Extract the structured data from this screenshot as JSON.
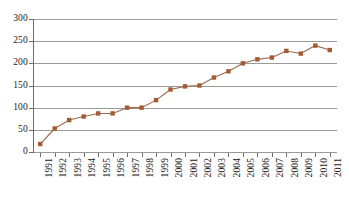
{
  "chart_data": {
    "type": "line",
    "title": "",
    "subtitle": "",
    "xlabel": "",
    "ylabel": "",
    "categories": [
      "1991",
      "1992",
      "1993",
      "1994",
      "1995",
      "1996",
      "1997",
      "1998",
      "1999",
      "2000",
      "2001",
      "2002",
      "2003",
      "2004",
      "2005",
      "2006",
      "2007",
      "2008",
      "2009",
      "2010",
      "2011"
    ],
    "values": [
      18,
      53,
      72,
      80,
      87,
      87,
      100,
      100,
      117,
      141,
      148,
      150,
      168,
      182,
      200,
      209,
      213,
      228,
      222,
      240,
      230
    ],
    "series": [
      {
        "name": "series-1",
        "values": [
          18,
          53,
          72,
          80,
          87,
          87,
          100,
          100,
          117,
          141,
          148,
          150,
          168,
          182,
          200,
          209,
          213,
          228,
          222,
          240,
          230
        ]
      }
    ],
    "ylim": [
      0,
      300
    ],
    "y_ticks": [
      0,
      50,
      100,
      150,
      200,
      250,
      300
    ],
    "y_tick_labels": [
      "0",
      "50",
      "100",
      "150",
      "200",
      "250",
      "300"
    ],
    "grid": true,
    "grid_axis": "y",
    "legend": false,
    "legend_position": "none",
    "marker": "square",
    "colors": {
      "series_line": "#9C6B4F",
      "series_marker": "#A45A32",
      "gridline": "#9A9A9A",
      "axis": "#6E6E6E",
      "text": "#1B1B1B",
      "background": "#FFFFFF"
    }
  }
}
